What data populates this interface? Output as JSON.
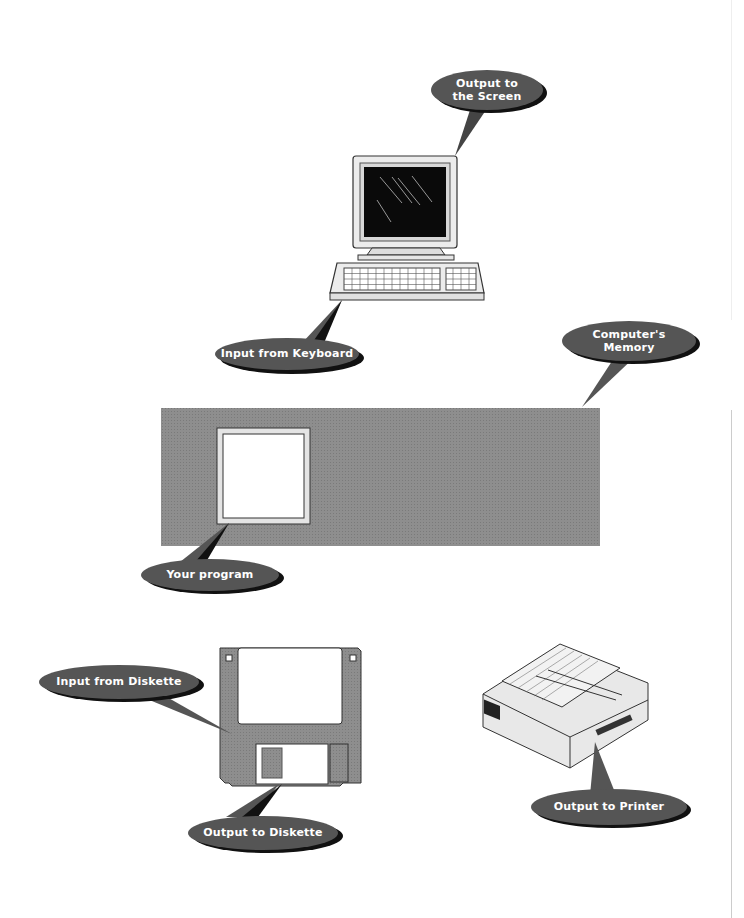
{
  "diagram": {
    "colors": {
      "bubble": "#555555",
      "bubble_shadow": "#111111",
      "memory_fill": "#8c8c8c",
      "device_fill": "#e6e6e6",
      "screen": "#0a0a0a"
    },
    "callouts": {
      "screen": {
        "line1": "Output to",
        "line2": "the Screen"
      },
      "keyboard": {
        "label": "Input from Keyboard"
      },
      "memory": {
        "line1": "Computer's",
        "line2": "Memory"
      },
      "program": {
        "label": "Your program"
      },
      "diskette_in": {
        "label": "Input from Diskette"
      },
      "diskette_out": {
        "label": "Output to Diskette"
      },
      "printer": {
        "label": "Output to Printer"
      }
    },
    "nodes": [
      "monitor-icon",
      "keyboard-icon",
      "memory-block",
      "program-box",
      "diskette-icon",
      "printer-icon"
    ]
  }
}
